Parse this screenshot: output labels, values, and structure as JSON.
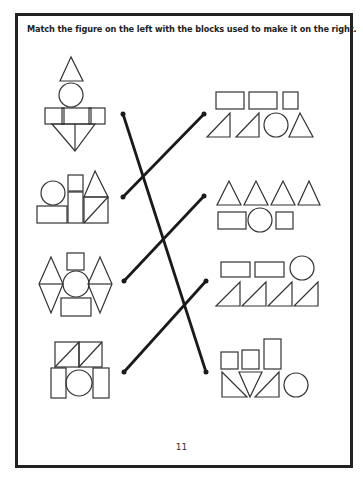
{
  "worksheet": {
    "instructions": "Match the figure on the left with the blocks used to make it on the right.",
    "page_number": "11",
    "colors": {
      "ink": "#222222",
      "background": "#ffffff"
    }
  },
  "left_figures": [
    {
      "id": "figure-1",
      "description": "triangle on circle on three rectangles on downward triangle split in two"
    },
    {
      "id": "figure-2",
      "description": "circle on rectangle, tall stacked squares, triangle on diagonally split square"
    },
    {
      "id": "figure-3",
      "description": "square on circle on rectangle flanked by two diamonds"
    },
    {
      "id": "figure-4",
      "description": "two diagonally split squares on two tall rectangles with a circle"
    }
  ],
  "right_block_sets": [
    {
      "id": "blocks-1",
      "description": "2 rectangles, 1 square, 2 right triangles, 1 circle, 1 triangle"
    },
    {
      "id": "blocks-2",
      "description": "4 triangles, 1 rectangle, 1 circle, 1 square"
    },
    {
      "id": "blocks-3",
      "description": "2 rectangles, 1 circle, 4 right triangles"
    },
    {
      "id": "blocks-4",
      "description": "2 squares, 1 tall rectangle, 2 right triangles, 1 inverted triangle, 1 circle"
    }
  ],
  "match_lines": [
    {
      "from": "figure-1",
      "to": "blocks-4"
    },
    {
      "from": "figure-2",
      "to": "blocks-1"
    },
    {
      "from": "figure-3",
      "to": "blocks-2"
    },
    {
      "from": "figure-4",
      "to": "blocks-3"
    }
  ]
}
